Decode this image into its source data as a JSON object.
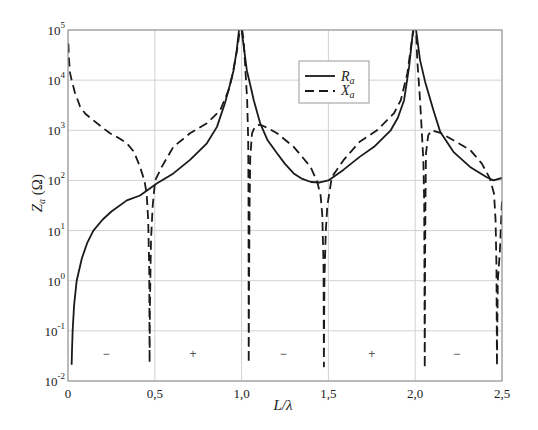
{
  "chart_data": {
    "type": "line",
    "title": "",
    "xlabel": "L/λ",
    "ylabel": "Z_a (Ω)",
    "ylabel_parts": {
      "main": "Z",
      "sub": "a",
      "unit": " (Ω)"
    },
    "xscale": "linear",
    "yscale": "log",
    "xlim": [
      0,
      2.5
    ],
    "ylim": [
      0.01,
      100000
    ],
    "grid": true,
    "x_ticks": [
      {
        "value": 0,
        "label": "0"
      },
      {
        "value": 0.5,
        "label": "0,5"
      },
      {
        "value": 1.0,
        "label": "1,0"
      },
      {
        "value": 1.5,
        "label": "1,5"
      },
      {
        "value": 2.0,
        "label": "2,0"
      },
      {
        "value": 2.5,
        "label": "2,5"
      }
    ],
    "y_ticks": [
      {
        "value": 0.01,
        "base": "10",
        "exp": "-2"
      },
      {
        "value": 0.1,
        "base": "10",
        "exp": "-1"
      },
      {
        "value": 1,
        "base": "10",
        "exp": "0"
      },
      {
        "value": 10,
        "base": "10",
        "exp": "1"
      },
      {
        "value": 100,
        "base": "10",
        "exp": "2"
      },
      {
        "value": 1000,
        "base": "10",
        "exp": "3"
      },
      {
        "value": 10000,
        "base": "10",
        "exp": "4"
      },
      {
        "value": 100000,
        "base": "10",
        "exp": "5"
      }
    ],
    "legend": {
      "position": "upper center",
      "entries": [
        {
          "name": "R_a",
          "main": "R",
          "sub": "a",
          "style": "solid"
        },
        {
          "name": "X_a",
          "main": "X",
          "sub": "a",
          "style": "dashed"
        }
      ]
    },
    "series": [
      {
        "name": "R_a",
        "style": "solid",
        "color": "#1a1a1a",
        "points": [
          [
            0.021,
            0.021
          ],
          [
            0.023,
            0.04
          ],
          [
            0.027,
            0.105
          ],
          [
            0.035,
            0.32
          ],
          [
            0.05,
            1.0
          ],
          [
            0.08,
            2.8
          ],
          [
            0.11,
            5.6
          ],
          [
            0.146,
            10
          ],
          [
            0.2,
            16.6
          ],
          [
            0.25,
            24
          ],
          [
            0.339,
            40
          ],
          [
            0.415,
            50
          ],
          [
            0.511,
            87
          ],
          [
            0.607,
            138
          ],
          [
            0.703,
            257
          ],
          [
            0.8,
            550
          ],
          [
            0.858,
            1170
          ],
          [
            0.904,
            3470
          ],
          [
            0.935,
            8710
          ],
          [
            0.954,
            15800
          ],
          [
            0.972,
            39800
          ],
          [
            0.985,
            100000
          ],
          [
            0.993,
            200000
          ],
          [
            1.0,
            100000
          ],
          [
            1.015,
            39800
          ],
          [
            1.03,
            15800
          ],
          [
            1.057,
            6310
          ],
          [
            1.07,
            3980
          ],
          [
            1.107,
            1380
          ],
          [
            1.15,
            631
          ],
          [
            1.204,
            347
          ],
          [
            1.25,
            214
          ],
          [
            1.3,
            138
          ],
          [
            1.35,
            107
          ],
          [
            1.4,
            93
          ],
          [
            1.45,
            91
          ],
          [
            1.5,
            100
          ],
          [
            1.586,
            162
          ],
          [
            1.68,
            295
          ],
          [
            1.763,
            468
          ],
          [
            1.859,
            1000
          ],
          [
            1.9,
            1780
          ],
          [
            1.936,
            3980
          ],
          [
            1.965,
            18600
          ],
          [
            1.988,
            100000
          ],
          [
            1.996,
            200000
          ],
          [
            2.005,
            100000
          ],
          [
            2.028,
            25100
          ],
          [
            2.057,
            9330
          ],
          [
            2.105,
            2510
          ],
          [
            2.144,
            933
          ],
          [
            2.22,
            372
          ],
          [
            2.316,
            186
          ],
          [
            2.41,
            117
          ],
          [
            2.45,
            100
          ],
          [
            2.5,
            112
          ]
        ]
      },
      {
        "name": "X_a",
        "style": "dashed",
        "color": "#1a1a1a",
        "points": [
          [
            0.002,
            53700
          ],
          [
            0.006,
            25100
          ],
          [
            0.012,
            13800
          ],
          [
            0.021,
            10000
          ],
          [
            0.04,
            5620
          ],
          [
            0.07,
            2950
          ],
          [
            0.1,
            2140
          ],
          [
            0.146,
            1580
          ],
          [
            0.2,
            1120
          ],
          [
            0.242,
            871
          ],
          [
            0.29,
            708
          ],
          [
            0.339,
            550
          ],
          [
            0.38,
            372
          ],
          [
            0.415,
            186
          ],
          [
            0.44,
            100
          ],
          [
            0.453,
            55
          ],
          [
            0.462,
            15.8
          ],
          [
            0.468,
            1.58
          ],
          [
            0.47,
            0.023
          ],
          [
            0.472,
            0.32
          ],
          [
            0.478,
            6.3
          ],
          [
            0.488,
            31.6
          ],
          [
            0.502,
            100
          ],
          [
            0.54,
            186
          ],
          [
            0.607,
            468
          ],
          [
            0.703,
            871
          ],
          [
            0.8,
            1380
          ],
          [
            0.877,
            2510
          ],
          [
            0.925,
            6310
          ],
          [
            0.945,
            11700
          ],
          [
            0.974,
            39800
          ],
          [
            0.99,
            100000
          ],
          [
            0.997,
            200000
          ],
          [
            1.003,
            100000
          ],
          [
            1.012,
            63100
          ],
          [
            1.022,
            15800
          ],
          [
            1.032,
            3980
          ],
          [
            1.038,
            631
          ],
          [
            1.04,
            31.6
          ],
          [
            1.041,
            0.023
          ],
          [
            1.043,
            1.0
          ],
          [
            1.046,
            31.6
          ],
          [
            1.05,
            295
          ],
          [
            1.06,
            871
          ],
          [
            1.075,
            1150
          ],
          [
            1.09,
            1260
          ],
          [
            1.107,
            1290
          ],
          [
            1.15,
            1120
          ],
          [
            1.204,
            871
          ],
          [
            1.3,
            468
          ],
          [
            1.397,
            186
          ],
          [
            1.436,
            93
          ],
          [
            1.455,
            50
          ],
          [
            1.465,
            20
          ],
          [
            1.472,
            2.0
          ],
          [
            1.474,
            0.0195
          ],
          [
            1.477,
            1.0
          ],
          [
            1.485,
            10
          ],
          [
            1.494,
            31.6
          ],
          [
            1.52,
            117
          ],
          [
            1.586,
            251
          ],
          [
            1.68,
            589
          ],
          [
            1.78,
            1000
          ],
          [
            1.878,
            2190
          ],
          [
            1.917,
            3980
          ],
          [
            1.955,
            13800
          ],
          [
            1.984,
            74100
          ],
          [
            1.99,
            100000
          ],
          [
            1.998,
            200000
          ],
          [
            2.005,
            100000
          ],
          [
            2.012,
            25100
          ],
          [
            2.028,
            3980
          ],
          [
            2.047,
            251
          ],
          [
            2.052,
            31.6
          ],
          [
            2.055,
            0.018
          ],
          [
            2.057,
            3.2
          ],
          [
            2.059,
            31.6
          ],
          [
            2.062,
            347
          ],
          [
            2.075,
            794
          ],
          [
            2.095,
            1000
          ],
          [
            2.144,
            891
          ],
          [
            2.22,
            631
          ],
          [
            2.316,
            407
          ],
          [
            2.383,
            219
          ],
          [
            2.43,
            110
          ],
          [
            2.454,
            55
          ],
          [
            2.463,
            15.8
          ],
          [
            2.468,
            2.0
          ],
          [
            2.471,
            0.02
          ],
          [
            2.472,
            0.063
          ],
          [
            2.476,
            1.0
          ],
          [
            2.488,
            4.0
          ],
          [
            2.495,
            15.8
          ],
          [
            2.5,
            40
          ]
        ]
      }
    ],
    "annotations": [
      {
        "text": "−",
        "x": 0.22,
        "y": 0.034,
        "meaning": "X_a negative"
      },
      {
        "text": "+",
        "x": 0.72,
        "y": 0.034,
        "meaning": "X_a positive"
      },
      {
        "text": "−",
        "x": 1.24,
        "y": 0.034,
        "meaning": "X_a negative"
      },
      {
        "text": "+",
        "x": 1.75,
        "y": 0.034,
        "meaning": "X_a positive"
      },
      {
        "text": "−",
        "x": 2.24,
        "y": 0.034,
        "meaning": "X_a negative"
      }
    ],
    "colors": {
      "curve": "#1a1a1a",
      "grid": "#d2d2d2",
      "frame": "#8c8c8c",
      "legend_border": "#999999"
    }
  }
}
